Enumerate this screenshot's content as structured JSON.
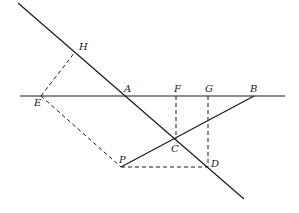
{
  "diagram": {
    "type": "geometry-construction",
    "points": {
      "H": {
        "label": "H",
        "x": 75,
        "y": 52,
        "lx": 79,
        "ly": 50
      },
      "A": {
        "label": "A",
        "x": 126,
        "y": 96,
        "lx": 124,
        "ly": 92
      },
      "E": {
        "label": "E",
        "x": 41,
        "y": 96,
        "lx": 34,
        "ly": 106
      },
      "F": {
        "label": "F",
        "x": 176,
        "y": 96,
        "lx": 174,
        "ly": 92
      },
      "G": {
        "label": "G",
        "x": 208,
        "y": 96,
        "lx": 205,
        "ly": 92
      },
      "B": {
        "label": "B",
        "x": 254,
        "y": 96,
        "lx": 250,
        "ly": 92
      },
      "C": {
        "label": "C",
        "x": 176,
        "y": 139,
        "lx": 171,
        "ly": 152
      },
      "D": {
        "label": "D",
        "x": 208,
        "y": 167,
        "lx": 211,
        "ly": 167
      },
      "P": {
        "label": "P",
        "x": 121,
        "y": 167,
        "lx": 119,
        "ly": 163
      }
    },
    "solid_lines": [
      {
        "name": "diagonal-line",
        "x1": 18,
        "y1": 3,
        "x2": 244,
        "y2": 199
      },
      {
        "name": "horizontal-line-AB",
        "x1": 20,
        "y1": 96,
        "x2": 285,
        "y2": 96
      },
      {
        "name": "line-PB",
        "x1": 121,
        "y1": 167,
        "x2": 254,
        "y2": 96
      }
    ],
    "dashed_lines": [
      {
        "name": "dashed-EH",
        "x1": 41,
        "y1": 96,
        "x2": 75,
        "y2": 52
      },
      {
        "name": "dashed-EP",
        "x1": 41,
        "y1": 96,
        "x2": 121,
        "y2": 167
      },
      {
        "name": "dashed-PD",
        "x1": 121,
        "y1": 167,
        "x2": 208,
        "y2": 167
      },
      {
        "name": "dashed-FC",
        "x1": 176,
        "y1": 96,
        "x2": 176,
        "y2": 139
      },
      {
        "name": "dashed-GD",
        "x1": 208,
        "y1": 96,
        "x2": 208,
        "y2": 167
      }
    ]
  }
}
